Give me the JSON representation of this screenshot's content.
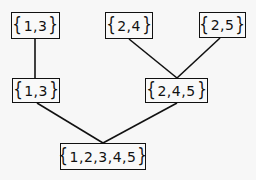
{
  "diagram": {
    "type": "tree",
    "nodes": [
      {
        "id": "top-13",
        "label": "1,3",
        "set": [
          1,
          3
        ],
        "x": 11,
        "y": 12,
        "w": 49,
        "h": 27
      },
      {
        "id": "top-24",
        "label": "2,4",
        "set": [
          2,
          4
        ],
        "x": 105,
        "y": 12,
        "w": 48,
        "h": 27
      },
      {
        "id": "top-25",
        "label": "2,5",
        "set": [
          2,
          5
        ],
        "x": 199,
        "y": 12,
        "w": 47,
        "h": 26
      },
      {
        "id": "mid-13",
        "label": "1,3",
        "set": [
          1,
          3
        ],
        "x": 12,
        "y": 78,
        "w": 48,
        "h": 25
      },
      {
        "id": "mid-245",
        "label": "2,4,5",
        "set": [
          2,
          4,
          5
        ],
        "x": 145,
        "y": 78,
        "w": 63,
        "h": 25
      },
      {
        "id": "root-12345",
        "label": "1,2,3,4,5",
        "set": [
          1,
          2,
          3,
          4,
          5
        ],
        "x": 60,
        "y": 143,
        "w": 86,
        "h": 27
      }
    ],
    "edges": [
      {
        "from": "top-13",
        "to": "mid-13",
        "x1": 35,
        "y1": 39,
        "x2": 35,
        "y2": 78
      },
      {
        "from": "top-24",
        "to": "mid-245",
        "x1": 129,
        "y1": 39,
        "x2": 177,
        "y2": 78
      },
      {
        "from": "top-25",
        "to": "mid-245",
        "x1": 220,
        "y1": 38,
        "x2": 177,
        "y2": 78
      },
      {
        "from": "mid-13",
        "to": "root-12345",
        "x1": 37,
        "y1": 103,
        "x2": 103,
        "y2": 143
      },
      {
        "from": "mid-245",
        "to": "root-12345",
        "x1": 177,
        "y1": 103,
        "x2": 103,
        "y2": 143
      }
    ],
    "brace_open": "{",
    "brace_close": "}"
  }
}
